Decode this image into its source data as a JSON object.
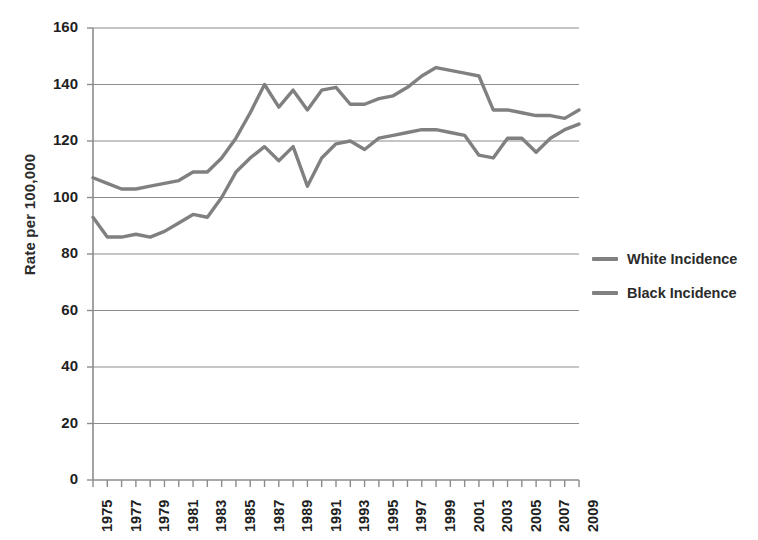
{
  "chart_data": {
    "type": "line",
    "title": "",
    "subtitle": "",
    "xlabel": "",
    "ylabel": "Rate per 100,000",
    "ylim": [
      0,
      160
    ],
    "ytick_step": 20,
    "yticks": [
      160,
      140,
      120,
      100,
      80,
      60,
      40,
      20,
      0
    ],
    "ytick_labels": [
      "160",
      "140",
      "120",
      "100",
      "80",
      "60",
      "40",
      "20",
      "0"
    ],
    "grid": true,
    "grid_axis": "y",
    "legend_position": "right",
    "x": [
      1975,
      1976,
      1977,
      1978,
      1979,
      1980,
      1981,
      1982,
      1983,
      1984,
      1985,
      1986,
      1987,
      1988,
      1989,
      1990,
      1991,
      1992,
      1993,
      1994,
      1995,
      1996,
      1997,
      1998,
      1999,
      2000,
      2001,
      2002,
      2003,
      2004,
      2005,
      2006,
      2007,
      2008,
      2009
    ],
    "xtick_labels": [
      "1975",
      "1977",
      "1979",
      "1981",
      "1983",
      "1985",
      "1987",
      "1989",
      "1991",
      "1993",
      "1995",
      "1997",
      "1999",
      "2001",
      "2003",
      "2005",
      "2007",
      "2009"
    ],
    "xtick_label_years": [
      1975,
      1977,
      1979,
      1981,
      1983,
      1985,
      1987,
      1989,
      1991,
      1993,
      1995,
      1997,
      1999,
      2001,
      2003,
      2005,
      2007,
      2009
    ],
    "xlim": [
      1975,
      2009
    ],
    "series": [
      {
        "name": "White Incidence",
        "color": "#808080",
        "values": [
          107,
          105,
          103,
          103,
          104,
          105,
          106,
          109,
          109,
          114,
          121,
          130,
          140,
          132,
          138,
          131,
          138,
          139,
          133,
          133,
          135,
          136,
          139,
          143,
          146,
          145,
          144,
          143,
          131,
          131,
          130,
          129,
          129,
          128,
          131
        ]
      },
      {
        "name": "Black Incidence",
        "color": "#808080",
        "values": [
          93,
          86,
          86,
          87,
          86,
          88,
          91,
          94,
          93,
          100,
          109,
          114,
          118,
          113,
          118,
          104,
          114,
          119,
          120,
          117,
          121,
          122,
          123,
          124,
          124,
          123,
          122,
          115,
          114,
          121,
          121,
          116,
          121,
          124,
          126
        ]
      }
    ]
  },
  "legend": {
    "items": [
      {
        "label": "White Incidence",
        "color": "#808080"
      },
      {
        "label": "Black Incidence",
        "color": "#808080"
      }
    ]
  }
}
